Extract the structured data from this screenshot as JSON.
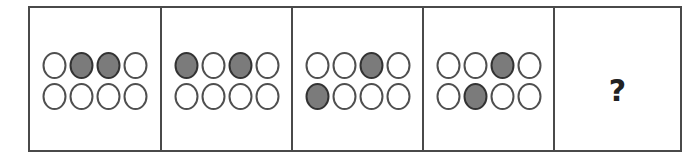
{
  "puzzle": {
    "title": "Circle grid sequence puzzle",
    "rows": 2,
    "cols": 4,
    "colors": {
      "filled": "#7b7b7b",
      "empty": "#ffffff",
      "stroke": "#4f4f4f",
      "frame": "#4a4a4a"
    },
    "panels": [
      {
        "index": 1,
        "filled": [
          [
            0,
            1
          ],
          [
            0,
            2
          ]
        ]
      },
      {
        "index": 2,
        "filled": [
          [
            0,
            0
          ],
          [
            0,
            2
          ]
        ]
      },
      {
        "index": 3,
        "filled": [
          [
            0,
            2
          ],
          [
            1,
            0
          ]
        ]
      },
      {
        "index": 4,
        "filled": [
          [
            0,
            2
          ],
          [
            1,
            1
          ]
        ]
      },
      {
        "index": 5,
        "question_mark": "?"
      }
    ]
  }
}
